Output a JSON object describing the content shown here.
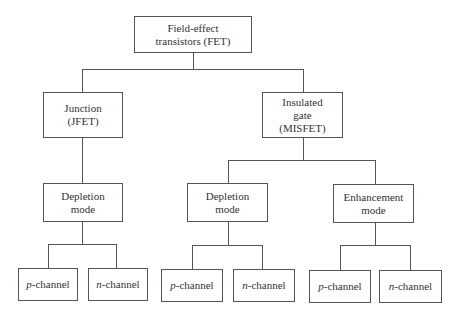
{
  "diagram": {
    "root": {
      "line1": "Field-effect",
      "line2": "transistors (FET)"
    },
    "junction": {
      "line1": "Junction",
      "line2": "(JFET)"
    },
    "insulated": {
      "line1": "Insulated",
      "line2": "gate",
      "line3": "(MISFET)"
    },
    "jfet_depletion": {
      "line1": "Depletion",
      "line2": "mode"
    },
    "misfet_depletion": {
      "line1": "Depletion",
      "line2": "mode"
    },
    "misfet_enhancement": {
      "line1": "Enhancement",
      "line2": "mode"
    },
    "leaves": [
      {
        "prefix": "p",
        "suffix": "-channel"
      },
      {
        "prefix": "n",
        "suffix": "-channel"
      },
      {
        "prefix": "p",
        "suffix": "-channel"
      },
      {
        "prefix": "n",
        "suffix": "-channel"
      },
      {
        "prefix": "p",
        "suffix": "-channel"
      },
      {
        "prefix": "n",
        "suffix": "-channel"
      }
    ]
  }
}
